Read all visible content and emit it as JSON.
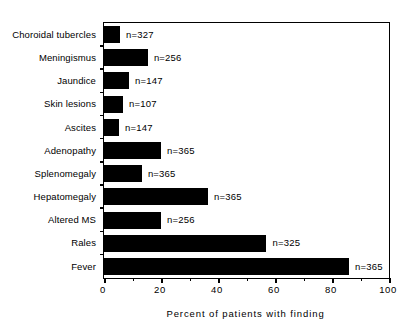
{
  "chart_data": {
    "type": "bar",
    "orientation": "horizontal",
    "title": "",
    "xlabel": "Percent of patients with finding",
    "ylabel": "",
    "xlim": [
      0,
      100
    ],
    "xticks": [
      0,
      20,
      40,
      60,
      80,
      100
    ],
    "xtick_labels": [
      "0",
      "20",
      "40",
      "60",
      "80",
      "100"
    ],
    "grid": false,
    "legend": null,
    "bar_color": "#000000",
    "background_color": "#FFFFFF",
    "categories": [
      "Choroidal tubercles",
      "Meningismus",
      "Jaundice",
      "Skin lesions",
      "Ascites",
      "Adenopathy",
      "Splenomegaly",
      "Hepatomegaly",
      "Altered MS",
      "Rales",
      "Fever"
    ],
    "values": [
      5.6,
      15.4,
      8.8,
      6.7,
      5.3,
      20.0,
      13.3,
      36.5,
      20.0,
      57.0,
      86.0
    ],
    "point_labels": [
      "n=327",
      "n=256",
      "n=147",
      "n=107",
      "n=147",
      "n=365",
      "n=365",
      "n=365",
      "n=256",
      "n=325",
      "n=365"
    ],
    "n_values": [
      327,
      256,
      147,
      107,
      147,
      365,
      365,
      365,
      256,
      325,
      365
    ]
  }
}
